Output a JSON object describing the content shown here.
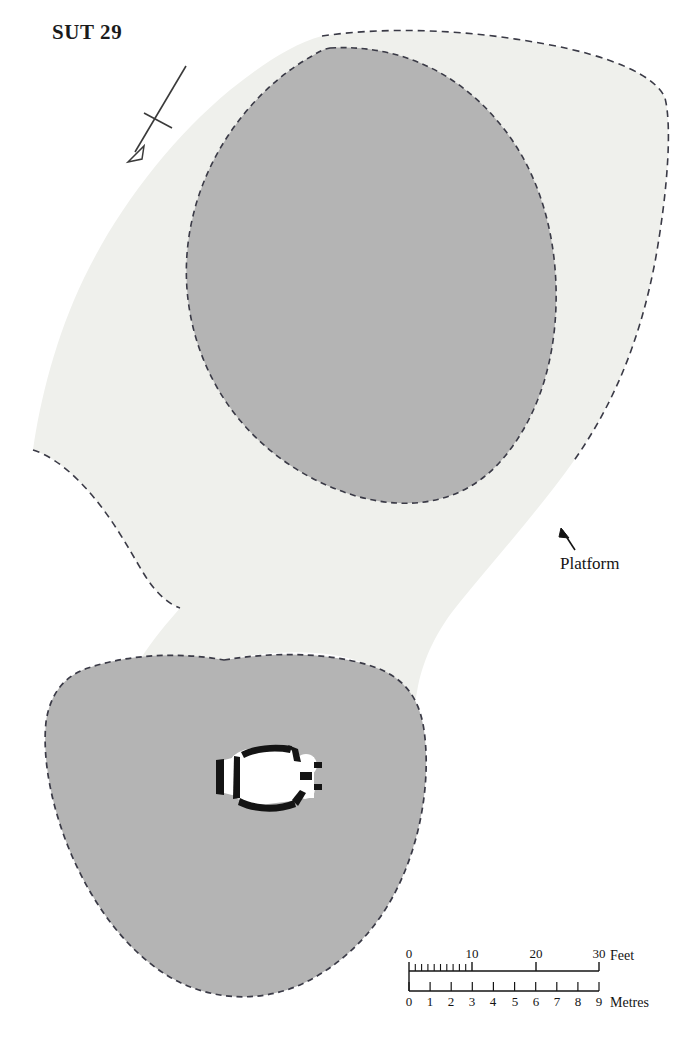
{
  "figure": {
    "title": "SUT 29",
    "kind": "archaeological-site-plan"
  },
  "annotations": {
    "platform_label": "Platform",
    "north_arrow_name": "north-arrow"
  },
  "features": [
    {
      "name": "upper-mound",
      "fill": "#b4b4b4",
      "outline": "dashed"
    },
    {
      "name": "platform",
      "fill": "#eff0ec",
      "outline": "dashed"
    },
    {
      "name": "lower-mound",
      "fill": "#b4b4b4",
      "outline": "dashed"
    },
    {
      "name": "structure-plan",
      "fill": "#ffffff",
      "walls": "#141414"
    }
  ],
  "colors": {
    "mound_fill": "#b4b4b4",
    "platform_fill": "#eff0ec",
    "outline": "#3a3a46",
    "ink": "#141414",
    "paper": "#ffffff"
  },
  "scale_bar": {
    "feet": {
      "unit_label": "Feet",
      "ticks": [
        "0",
        "10",
        "20",
        "30"
      ],
      "tick_values": [
        0,
        10,
        20,
        30
      ],
      "max": 30,
      "minor_step": 1,
      "minor_range": [
        0,
        10
      ]
    },
    "metres": {
      "unit_label": "Metres",
      "ticks": [
        "0",
        "1",
        "2",
        "3",
        "4",
        "5",
        "6",
        "7",
        "8",
        "9"
      ],
      "tick_values": [
        0,
        1,
        2,
        3,
        4,
        5,
        6,
        7,
        8,
        9
      ],
      "max": 9,
      "minor_step": 1
    }
  }
}
